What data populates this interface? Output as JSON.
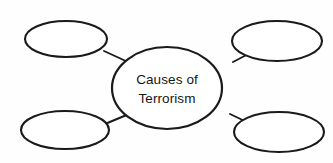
{
  "diagram": {
    "type": "mind-map",
    "title": "Causes of Terrorism",
    "background_color": "#fefefe",
    "stroke_color": "#1a1a1a",
    "fill_color": "#ffffff",
    "center": {
      "id": "center-node",
      "line1": "Causes of",
      "line2": "Terrorism",
      "cx": 167,
      "cy": 88,
      "rx": 55,
      "ry": 41
    },
    "branches": [
      {
        "id": "branch-top-left",
        "label": "",
        "cx": 66,
        "cy": 39,
        "rx": 41,
        "ry": 18
      },
      {
        "id": "branch-top-right",
        "label": "",
        "cx": 277,
        "cy": 41,
        "rx": 45,
        "ry": 20
      },
      {
        "id": "branch-bottom-left",
        "label": "",
        "cx": 65,
        "cy": 130,
        "rx": 44,
        "ry": 19
      },
      {
        "id": "branch-bottom-right",
        "label": "",
        "cx": 279,
        "cy": 132,
        "rx": 45,
        "ry": 20
      }
    ],
    "connectors": [
      {
        "id": "connector-top-left",
        "x1": 104,
        "y1": 51,
        "x2": 128,
        "y2": 62
      },
      {
        "id": "connector-top-right",
        "x1": 233,
        "y1": 62,
        "x2": 254,
        "y2": 51
      },
      {
        "id": "connector-bottom-left",
        "x1": 105,
        "y1": 124,
        "x2": 129,
        "y2": 114
      },
      {
        "id": "connector-bottom-right",
        "x1": 230,
        "y1": 114,
        "x2": 253,
        "y2": 125
      }
    ]
  }
}
